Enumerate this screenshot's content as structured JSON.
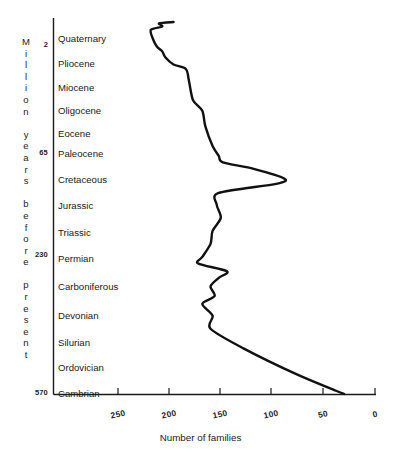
{
  "chart_data": {
    "type": "line",
    "title": "",
    "xlabel": "Number of families",
    "ylabel": "Million years before present",
    "orientation": "horizontal-time-vertical",
    "grid": false,
    "legend": null,
    "xlim": [
      250,
      0
    ],
    "x_reversed": true,
    "xticks": [
      250,
      200,
      150,
      100,
      50,
      0
    ],
    "xtick_labels": [
      "250",
      "200",
      "150",
      "100",
      "50",
      "0"
    ],
    "ylim": [
      570,
      0
    ],
    "yticks": [
      2,
      65,
      230,
      570
    ],
    "ytick_labels": [
      "2",
      "65",
      "230",
      "570"
    ],
    "y_categories": [
      "Quaternary",
      "Pliocene",
      "Miocene",
      "Oligocene",
      "Eocene",
      "Paleocene",
      "Cretaceous",
      "Jurassic",
      "Triassic",
      "Permian",
      "Carboniferous",
      "Devonian",
      "Silurian",
      "Ordovician",
      "Cambrian"
    ],
    "series": [
      {
        "name": "Number of families",
        "points": [
          {
            "period": "Quaternary",
            "families": 196,
            "age": 0
          },
          {
            "period": "Quaternary",
            "families": 210,
            "age": 2
          },
          {
            "period": "Pliocene",
            "families": 207,
            "age": 7
          },
          {
            "period": "Pliocene",
            "families": 218,
            "age": 12
          },
          {
            "period": "Miocene",
            "families": 216,
            "age": 26
          },
          {
            "period": "Oligocene",
            "families": 212,
            "age": 38
          },
          {
            "period": "Oligocene",
            "families": 207,
            "age": 45
          },
          {
            "period": "Eocene",
            "families": 204,
            "age": 54
          },
          {
            "period": "Paleocene",
            "families": 196,
            "age": 65
          },
          {
            "period": "Paleocene",
            "families": 184,
            "age": 72
          },
          {
            "period": "Cretaceous",
            "families": 181,
            "age": 90
          },
          {
            "period": "Cretaceous",
            "families": 177,
            "age": 120
          },
          {
            "period": "Cretaceous",
            "families": 168,
            "age": 136
          },
          {
            "period": "Jurassic",
            "families": 165,
            "age": 160
          },
          {
            "period": "Jurassic",
            "families": 158,
            "age": 190
          },
          {
            "period": "Triassic",
            "families": 152,
            "age": 205
          },
          {
            "period": "Triassic",
            "families": 148,
            "age": 215
          },
          {
            "period": "Triassic",
            "families": 118,
            "age": 225
          },
          {
            "period": "Permian",
            "families": 88,
            "age": 240
          },
          {
            "period": "Permian",
            "families": 96,
            "age": 248
          },
          {
            "period": "Permian",
            "families": 152,
            "age": 262
          },
          {
            "period": "Carboniferous",
            "families": 154,
            "age": 280
          },
          {
            "period": "Carboniferous",
            "families": 150,
            "age": 300
          },
          {
            "period": "Carboniferous",
            "families": 158,
            "age": 320
          },
          {
            "period": "Carboniferous",
            "families": 160,
            "age": 340
          },
          {
            "period": "Devonian",
            "families": 168,
            "age": 360
          },
          {
            "period": "Devonian",
            "families": 172,
            "age": 370
          },
          {
            "period": "Devonian",
            "families": 144,
            "age": 382
          },
          {
            "period": "Devonian",
            "families": 152,
            "age": 392
          },
          {
            "period": "Silurian",
            "families": 160,
            "age": 405
          },
          {
            "period": "Silurian",
            "families": 156,
            "age": 420
          },
          {
            "period": "Silurian",
            "families": 168,
            "age": 432
          },
          {
            "period": "Ordovician",
            "families": 158,
            "age": 450
          },
          {
            "period": "Ordovician",
            "families": 160,
            "age": 470
          },
          {
            "period": "Ordovician",
            "families": 128,
            "age": 500
          },
          {
            "period": "Cambrian",
            "families": 76,
            "age": 540
          },
          {
            "period": "Cambrian",
            "families": 38,
            "age": 565
          },
          {
            "period": "Cambrian",
            "families": 30,
            "age": 570
          }
        ]
      }
    ],
    "axis_color": "#1a1a1a",
    "line_color": "#111111"
  },
  "axes": {
    "vertical_title_letters": [
      "M",
      "i",
      "l",
      "l",
      "i",
      "o",
      "n",
      "",
      "y",
      "e",
      "a",
      "r",
      "s",
      "",
      "b",
      "e",
      "f",
      "o",
      "r",
      "e",
      "",
      "p",
      "r",
      "e",
      "s",
      "e",
      "n",
      "t"
    ],
    "vertical_title_text": "Million years before present",
    "epoch_ticks": [
      {
        "label": "2",
        "top": 40
      },
      {
        "label": "65",
        "top": 148
      },
      {
        "label": "230",
        "top": 250
      },
      {
        "label": "570",
        "top": 388
      }
    ],
    "period_labels": [
      {
        "label": "Quaternary",
        "top": 33
      },
      {
        "label": "Pliocene",
        "top": 58
      },
      {
        "label": "Miocene",
        "top": 82
      },
      {
        "label": "Oligocene",
        "top": 105
      },
      {
        "label": "Eocene",
        "top": 128
      },
      {
        "label": "Paleocene",
        "top": 148
      },
      {
        "label": "Cretaceous",
        "top": 174
      },
      {
        "label": "Jurassic",
        "top": 200
      },
      {
        "label": "Triassic",
        "top": 227
      },
      {
        "label": "Permian",
        "top": 253
      },
      {
        "label": "Carboniferous",
        "top": 281
      },
      {
        "label": "Devonian",
        "top": 310
      },
      {
        "label": "Silurian",
        "top": 337
      },
      {
        "label": "Ordovician",
        "top": 362
      },
      {
        "label": "Cambrian",
        "top": 388
      }
    ],
    "x_tick_labels": [
      {
        "label": "250",
        "left": 118
      },
      {
        "label": "200",
        "left": 169
      },
      {
        "label": "150",
        "left": 220
      },
      {
        "label": "100",
        "left": 271
      },
      {
        "label": "50",
        "left": 323
      },
      {
        "label": "0",
        "left": 375
      }
    ],
    "x_axis_title": "Number of families"
  }
}
